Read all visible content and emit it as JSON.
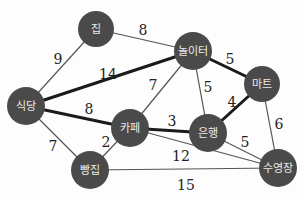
{
  "graph": {
    "node_color": "#4a4a4a",
    "label_color": "#ececec",
    "nodes": [
      {
        "id": "home",
        "label": "집",
        "x": 96,
        "y": 29,
        "r": 18
      },
      {
        "id": "playground",
        "label": "놀이터",
        "x": 193,
        "y": 51,
        "r": 19
      },
      {
        "id": "mart",
        "label": "마트",
        "x": 262,
        "y": 84,
        "r": 18
      },
      {
        "id": "restaurant",
        "label": "식당",
        "x": 26,
        "y": 106,
        "r": 19
      },
      {
        "id": "cafe",
        "label": "카페",
        "x": 130,
        "y": 128,
        "r": 19
      },
      {
        "id": "bank",
        "label": "은행",
        "x": 208,
        "y": 133,
        "r": 19
      },
      {
        "id": "bakery",
        "label": "빵집",
        "x": 90,
        "y": 170,
        "r": 19
      },
      {
        "id": "pool",
        "label": "수영장",
        "x": 278,
        "y": 168,
        "r": 19
      }
    ],
    "edges": [
      {
        "from": "home",
        "to": "restaurant",
        "weight": "9",
        "thick": false,
        "lx": 58,
        "ly": 60
      },
      {
        "from": "home",
        "to": "playground",
        "weight": "8",
        "thick": false,
        "lx": 143,
        "ly": 31
      },
      {
        "from": "restaurant",
        "to": "playground",
        "weight": "14",
        "thick": true,
        "lx": 108,
        "ly": 75
      },
      {
        "from": "playground",
        "to": "mart",
        "weight": "5",
        "thick": true,
        "lx": 230,
        "ly": 60
      },
      {
        "from": "playground",
        "to": "cafe",
        "weight": "7",
        "thick": false,
        "lx": 153,
        "ly": 86
      },
      {
        "from": "playground",
        "to": "bank",
        "weight": "5",
        "thick": false,
        "lx": 208,
        "ly": 88
      },
      {
        "from": "restaurant",
        "to": "cafe",
        "weight": "8",
        "thick": true,
        "lx": 89,
        "ly": 110
      },
      {
        "from": "cafe",
        "to": "bank",
        "weight": "3",
        "thick": true,
        "lx": 172,
        "ly": 122
      },
      {
        "from": "bank",
        "to": "mart",
        "weight": "4",
        "thick": true,
        "lx": 232,
        "ly": 103
      },
      {
        "from": "mart",
        "to": "pool",
        "weight": "6",
        "thick": false,
        "lx": 279,
        "ly": 125
      },
      {
        "from": "bank",
        "to": "pool",
        "weight": "5",
        "thick": false,
        "lx": 245,
        "ly": 143
      },
      {
        "from": "cafe",
        "to": "pool",
        "weight": "12",
        "thick": false,
        "lx": 181,
        "ly": 157
      },
      {
        "from": "restaurant",
        "to": "bakery",
        "weight": "7",
        "thick": false,
        "lx": 53,
        "ly": 147
      },
      {
        "from": "cafe",
        "to": "bakery",
        "weight": "2",
        "thick": false,
        "lx": 106,
        "ly": 143
      },
      {
        "from": "bakery",
        "to": "pool",
        "weight": "15",
        "thick": false,
        "lx": 186,
        "ly": 186
      }
    ]
  }
}
